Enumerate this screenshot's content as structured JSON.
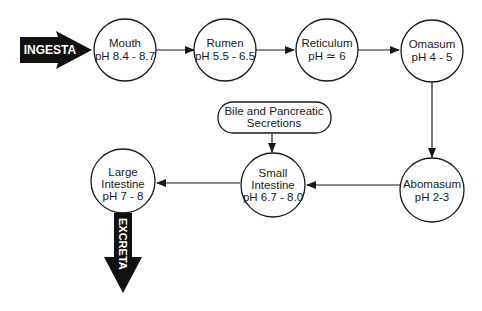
{
  "diagram": {
    "input_arrow": {
      "label": "INGESTA"
    },
    "output_arrow": {
      "label": "EXCRETA"
    },
    "nodes": [
      {
        "id": "mouth",
        "line1": "Mouth",
        "line2": "pH 8.4 - 8.7"
      },
      {
        "id": "rumen",
        "line1": "Rumen",
        "line2": "pH 5.5 - 6.5"
      },
      {
        "id": "reticulum",
        "line1": "Reticulum",
        "line2": "pH ≃ 6"
      },
      {
        "id": "omasum",
        "line1": "Omasum",
        "line2": "pH 4 - 5"
      },
      {
        "id": "abomasum",
        "line1": "Abomasum",
        "line2": "pH 2-3"
      },
      {
        "id": "small_intestine",
        "line1": "Small",
        "line2": "Intestine",
        "line3": "pH 6.7 - 8.0"
      },
      {
        "id": "large_intestine",
        "line1": "Large",
        "line2": "Intestine",
        "line3": "pH 7 - 8"
      }
    ],
    "side_input": {
      "line1": "Bile and Pancreatic",
      "line2": "Secretions"
    },
    "edges": [
      [
        "INGESTA",
        "mouth"
      ],
      [
        "mouth",
        "rumen"
      ],
      [
        "rumen",
        "reticulum"
      ],
      [
        "reticulum",
        "omasum"
      ],
      [
        "omasum",
        "abomasum"
      ],
      [
        "abomasum",
        "small_intestine"
      ],
      [
        "side_input",
        "small_intestine"
      ],
      [
        "small_intestine",
        "large_intestine"
      ],
      [
        "large_intestine",
        "EXCRETA"
      ]
    ],
    "colors": {
      "stroke": "#1a1a1a",
      "fill": "#ffffff",
      "arrow_fill": "#111111"
    }
  }
}
